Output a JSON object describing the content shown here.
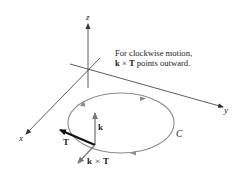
{
  "figure": {
    "axes": {
      "x_label": "x",
      "y_label": "y",
      "z_label": "z"
    },
    "curve_label": "C",
    "vectors": {
      "k_label": "k",
      "T_label": "T",
      "kxT_label_left": "k",
      "kxT_label_op": "×",
      "kxT_label_right": "T"
    },
    "annotation": {
      "line1": "For clockwise motion,",
      "line2_bold1": "k",
      "line2_op": " × ",
      "line2_bold2": "T",
      "line2_rest": " points outward."
    },
    "colors": {
      "axis": "#333333",
      "curve": "#8a8a8a",
      "vector_T": "#111111",
      "vector_gray": "#777777",
      "text": "#222222"
    }
  }
}
